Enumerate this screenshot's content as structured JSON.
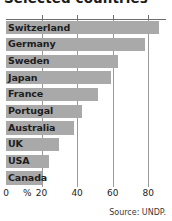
{
  "chart_data": {
    "type": "bar",
    "orientation": "horizontal",
    "title": "Selected countries",
    "xlabel": "%",
    "ylabel": "",
    "grid": true,
    "legend": null,
    "xlim": [
      0,
      90
    ],
    "xticks": [
      0,
      20,
      40,
      60,
      80
    ],
    "xtick_labels": [
      "0",
      "20",
      "40",
      "60",
      "80"
    ],
    "unit_symbol": "%",
    "categories": [
      "Switzerland",
      "Germany",
      "Sweden",
      "Japan",
      "France",
      "Portugal",
      "Australia",
      "UK",
      "USA",
      "Canada"
    ],
    "values": [
      86,
      78,
      63,
      59,
      52,
      43,
      38,
      30,
      24,
      20
    ],
    "bars": [
      {
        "label": "Switzerland",
        "value": 86
      },
      {
        "label": "Germany",
        "value": 78
      },
      {
        "label": "Sweden",
        "value": 63
      },
      {
        "label": "Japan",
        "value": 59
      },
      {
        "label": "France",
        "value": 52
      },
      {
        "label": "Portugal",
        "value": 43
      },
      {
        "label": "Australia",
        "value": 38
      },
      {
        "label": "UK",
        "value": 30
      },
      {
        "label": "USA",
        "value": 24
      },
      {
        "label": "Canada",
        "value": 20
      }
    ],
    "source": "Source: UNDP.",
    "colors": {
      "bar": "#a9a9a9",
      "gridline": "#9a9a9a",
      "axis": "#6d6d6d",
      "text": "#1d1d1d",
      "background": "#ffffff"
    }
  }
}
